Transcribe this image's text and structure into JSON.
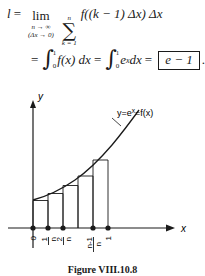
{
  "equation": {
    "line1": {
      "lhs": "l",
      "equals": "=",
      "limit_word": "lim",
      "limit_sub_top": "n → ∞",
      "limit_sub_bottom": "(Δx → 0)",
      "sum_symbol": "∑",
      "sum_upper": "n",
      "sum_lower": "k = 1",
      "body": "f((k − 1) Δx) Δx"
    },
    "line2": {
      "equals1": "=",
      "integral1": {
        "symbol": "∫",
        "upper": "1",
        "lower": "0",
        "integrand": "f(x) dx"
      },
      "equals2": "=",
      "integral2": {
        "symbol": "∫",
        "upper": "1",
        "lower": "0",
        "integrand": "e",
        "integrand_exp": "x",
        "integrand_tail": " dx"
      },
      "equals3": "=",
      "boxed_result": "e − 1",
      "period": "."
    }
  },
  "figure": {
    "y_axis_label": "y",
    "x_axis_label": "x",
    "curve_label_prefix": "y=e",
    "curve_label_exponent": "x",
    "curve_label_suffix": "=f(x)",
    "ticks": [
      {
        "label_num": "0",
        "label_den": "",
        "is_fraction": false
      },
      {
        "label_num": "1",
        "label_den": "n",
        "is_fraction": true
      },
      {
        "label_num": "2",
        "label_den": "n",
        "is_fraction": true
      },
      {
        "label_num": "n-1",
        "label_den": "n",
        "is_fraction": true
      },
      {
        "label_num": "1",
        "label_den": "",
        "is_fraction": false
      }
    ],
    "caption": "Figure VIII.10.8",
    "colors": {
      "ink": "#1a1a1a",
      "background": "#ffffff"
    }
  }
}
